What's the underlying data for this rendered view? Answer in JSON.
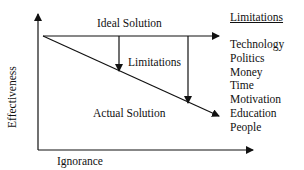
{
  "diagram": {
    "ideal_label": "Ideal Solution",
    "actual_label": "Actual Solution",
    "gap_label": "Limitations",
    "x_axis_label": "Ignorance",
    "y_axis_label": "Effectiveness",
    "limitations_title": "Limitations",
    "limitations": [
      "Technology",
      "Politics",
      "Money",
      "Time",
      "Motivation",
      "Education",
      "People"
    ],
    "colors": {
      "line": "#111111",
      "background": "#ffffff"
    }
  }
}
